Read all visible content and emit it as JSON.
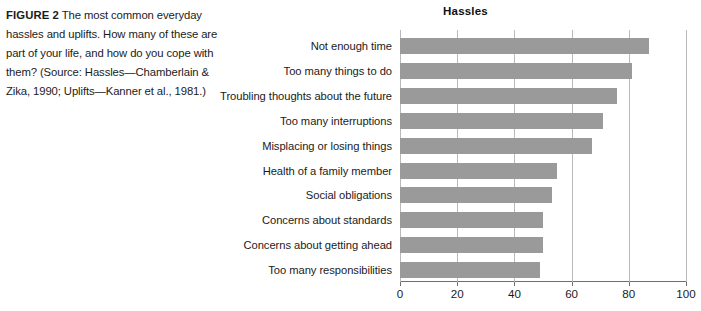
{
  "caption": {
    "figure_label": "FIGURE 2",
    "text": "  The most common everyday hassles and uplifts. How many of these are part of your life, and how do you cope with them? (Source: Hassles—Chamberlain & Zika, 1990; Uplifts—Kanner et al., 1981.)"
  },
  "colors": {
    "bar": "#9a9a9a",
    "gridline": "#b9b9b9",
    "axis": "#6f6f6f",
    "text": "#1b1b1b"
  },
  "chart_data": {
    "type": "bar",
    "orientation": "horizontal",
    "title": "Hassles",
    "xlabel": "",
    "ylabel": "",
    "xlim": [
      0,
      100
    ],
    "xticks": [
      0,
      20,
      40,
      60,
      80,
      100
    ],
    "xtick_labels": [
      "0",
      "20",
      "40",
      "60",
      "80",
      "100"
    ],
    "grid": true,
    "grid_axis": "x",
    "legend": false,
    "categories": [
      "Not enough time",
      "Too many things to do",
      "Troubling thoughts about the future",
      "Too many interruptions",
      "Misplacing or losing things",
      "Health of a family member",
      "Social obligations",
      "Concerns about standards",
      "Concerns about getting ahead",
      "Too many responsibilities"
    ],
    "values": [
      87,
      81,
      76,
      71,
      67,
      55,
      53,
      50,
      50,
      49
    ]
  }
}
